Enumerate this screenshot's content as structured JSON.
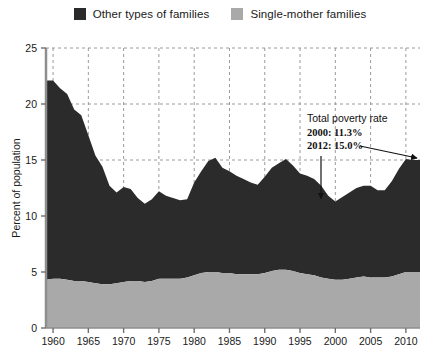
{
  "legend": {
    "items": [
      {
        "label": "Other types of families",
        "color": "#2b2b2b",
        "swatch_name": "legend-swatch-other-families"
      },
      {
        "label": "Single-mother families",
        "color": "#a9a9a9",
        "swatch_name": "legend-swatch-single-mother"
      }
    ]
  },
  "annotation": {
    "title": "Total poverty rate",
    "line_2000": "2000: 11.3%",
    "line_2012": "2012: 15.0%"
  },
  "chart_data": {
    "type": "area",
    "stacked": true,
    "title": "",
    "subtitle": "",
    "xlabel": "",
    "ylabel": "Percent of population",
    "xlim": [
      1959,
      2012
    ],
    "ylim": [
      0,
      25
    ],
    "ytick_labels": [
      "0",
      "5",
      "10",
      "15",
      "20",
      "25"
    ],
    "yticks": [
      0,
      5,
      10,
      15,
      20,
      25
    ],
    "xtick_labels": [
      "1960",
      "1965",
      "1970",
      "1975",
      "1980",
      "1985",
      "1990",
      "1995",
      "2000",
      "2005",
      "2010"
    ],
    "xticks": [
      1960,
      1965,
      1970,
      1975,
      1980,
      1985,
      1990,
      1995,
      2000,
      2005,
      2010
    ],
    "grid": true,
    "grid_style": "dashed",
    "legend_position": "top-center",
    "x": [
      1959,
      1960,
      1961,
      1962,
      1963,
      1964,
      1965,
      1966,
      1967,
      1968,
      1969,
      1970,
      1971,
      1972,
      1973,
      1974,
      1975,
      1976,
      1977,
      1978,
      1979,
      1980,
      1981,
      1982,
      1983,
      1984,
      1985,
      1986,
      1987,
      1988,
      1989,
      1990,
      1991,
      1992,
      1993,
      1994,
      1995,
      1996,
      1997,
      1998,
      1999,
      2000,
      2001,
      2002,
      2003,
      2004,
      2005,
      2006,
      2007,
      2008,
      2009,
      2010,
      2011,
      2012
    ],
    "series": [
      {
        "name": "Single-mother families",
        "color": "#a9a9a9",
        "values": [
          4.3,
          4.4,
          4.4,
          4.3,
          4.2,
          4.2,
          4.1,
          4.0,
          3.9,
          3.9,
          4.0,
          4.1,
          4.2,
          4.2,
          4.1,
          4.2,
          4.4,
          4.4,
          4.4,
          4.4,
          4.5,
          4.7,
          4.9,
          5.0,
          5.0,
          4.9,
          4.9,
          4.8,
          4.8,
          4.8,
          4.8,
          4.9,
          5.1,
          5.2,
          5.2,
          5.1,
          4.9,
          4.8,
          4.7,
          4.5,
          4.4,
          4.3,
          4.3,
          4.4,
          4.5,
          4.6,
          4.5,
          4.5,
          4.5,
          4.6,
          4.8,
          5.0,
          5.0,
          5.0
        ]
      },
      {
        "name": "Other types of families",
        "color": "#2b2b2b",
        "values": [
          17.8,
          17.7,
          17.0,
          16.6,
          15.3,
          14.8,
          13.1,
          11.4,
          10.5,
          8.8,
          8.1,
          8.5,
          8.2,
          7.4,
          7.0,
          7.3,
          7.8,
          7.4,
          7.2,
          7.0,
          7.0,
          8.3,
          9.1,
          9.9,
          10.2,
          9.4,
          9.1,
          8.8,
          8.5,
          8.2,
          8.0,
          8.6,
          9.2,
          9.5,
          9.9,
          9.4,
          8.9,
          8.8,
          8.6,
          8.2,
          7.4,
          7.0,
          7.4,
          7.7,
          8.0,
          8.1,
          8.2,
          7.8,
          7.8,
          8.5,
          9.4,
          10.1,
          10.0,
          10.0
        ]
      }
    ],
    "total": [
      22.1,
      22.1,
      21.4,
      20.9,
      19.5,
      19.0,
      17.2,
      15.4,
      14.4,
      12.7,
      12.1,
      12.6,
      12.4,
      11.6,
      11.1,
      11.5,
      12.2,
      11.8,
      11.6,
      11.4,
      11.5,
      13.0,
      14.0,
      14.9,
      15.2,
      14.3,
      14.0,
      13.6,
      13.3,
      13.0,
      12.8,
      13.5,
      14.3,
      14.7,
      15.1,
      14.5,
      13.8,
      13.6,
      13.3,
      12.7,
      11.8,
      11.3,
      11.7,
      12.1,
      12.5,
      12.7,
      12.7,
      12.3,
      12.3,
      13.1,
      14.2,
      15.1,
      15.0,
      15.0
    ],
    "annotations": [
      {
        "label": "Total poverty rate",
        "type": "text"
      },
      {
        "label": "2000: 11.3%",
        "x": 2000,
        "y": 11.3,
        "type": "arrow-down"
      },
      {
        "label": "2012: 15.0%",
        "x": 2012,
        "y": 15.0,
        "type": "arrow-diagonal"
      }
    ]
  }
}
